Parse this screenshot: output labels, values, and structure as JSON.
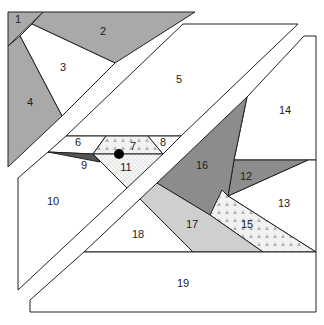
{
  "colors": {
    "white": "#ffffff",
    "medium_gray": "#a9a9a9",
    "dark_gray": "#8c8c8c",
    "light_gray": "#cfcfcf",
    "very_dark": "#555555",
    "outline": "#222222",
    "dot_fill": "#dcdcdc"
  },
  "pieces": [
    {
      "id": "1",
      "label": "1",
      "fill": "medium_gray"
    },
    {
      "id": "2",
      "label": "2",
      "fill": "medium_gray"
    },
    {
      "id": "3",
      "label": "3",
      "fill": "white"
    },
    {
      "id": "4",
      "label": "4",
      "fill": "medium_gray"
    },
    {
      "id": "5",
      "label": "5",
      "fill": "white"
    },
    {
      "id": "6",
      "label": "6",
      "fill": "white"
    },
    {
      "id": "7",
      "label": "7",
      "fill": "pattern-triangles"
    },
    {
      "id": "8",
      "label": "8",
      "fill": "white"
    },
    {
      "id": "9",
      "label": "9",
      "fill": "very_dark"
    },
    {
      "id": "10",
      "label": "10",
      "fill": "white"
    },
    {
      "id": "11",
      "label": "11",
      "fill": "pattern-dots"
    },
    {
      "id": "12",
      "label": "12",
      "fill": "dark_gray"
    },
    {
      "id": "13",
      "label": "13",
      "fill": "white"
    },
    {
      "id": "14",
      "label": "14",
      "fill": "white"
    },
    {
      "id": "15",
      "label": "15",
      "fill": "pattern-triangles"
    },
    {
      "id": "16",
      "label": "16",
      "fill": "dark_gray"
    },
    {
      "id": "17",
      "label": "17",
      "fill": "light_gray"
    },
    {
      "id": "18",
      "label": "18",
      "fill": "white"
    },
    {
      "id": "19",
      "label": "19",
      "fill": "white"
    }
  ],
  "eye_dot": {
    "label": "eye"
  }
}
